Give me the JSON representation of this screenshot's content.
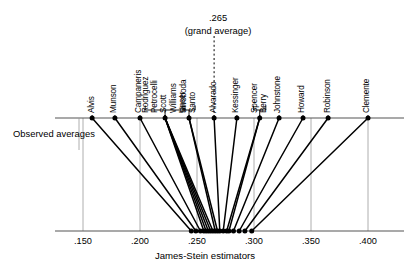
{
  "figure": {
    "observed_label": "Observed averages",
    "grand_average_value": ".265",
    "grand_average_caption": "(grand average)",
    "xaxis_title": "James-Stein estimators"
  },
  "chart_data": {
    "type": "scatter",
    "title": "",
    "subtitle": "",
    "xlabel": "James-Stein estimators",
    "ylabel": "",
    "xlim": [
      0.125,
      0.425
    ],
    "grid": true,
    "legend": "none",
    "grand_average": 0.265,
    "tick_labels": [
      ".150",
      ".200",
      ".250",
      ".300",
      ".350",
      ".400"
    ],
    "tick_values": [
      0.15,
      0.2,
      0.25,
      0.3,
      0.35,
      0.4
    ],
    "top_axis_label": "Observed averages",
    "bottom_axis_label": "James-Stein estimators",
    "series": [
      {
        "name": "Observed averages",
        "values": [
          0.158,
          0.178,
          0.2,
          0.222,
          0.23,
          0.238,
          0.244,
          0.25,
          0.254,
          0.26,
          0.265,
          0.276,
          0.286,
          0.292,
          0.298,
          0.318,
          0.333,
          0.348,
          0.362,
          0.4
        ]
      },
      {
        "name": "James-Stein estimators",
        "values": [
          0.245,
          0.249,
          0.253,
          0.255,
          0.257,
          0.259,
          0.261,
          0.263,
          0.265,
          0.266,
          0.268,
          0.27,
          0.271,
          0.273,
          0.275,
          0.279,
          0.283,
          0.287,
          0.291,
          0.298
        ]
      }
    ],
    "players": [
      {
        "label": "Alvis",
        "observed": 0.158,
        "james_stein": 0.245,
        "bracket": false
      },
      {
        "label": "Munson",
        "observed": 0.178,
        "james_stein": 0.249,
        "bracket": false
      },
      {
        "label": "Campaneris",
        "observed": 0.2,
        "james_stein": 0.253,
        "bracket": false
      },
      {
        "label": "Rodriguez",
        "observed": 0.222,
        "james_stein": 0.256,
        "bracket": true
      },
      {
        "label": "Petrocelli",
        "observed": 0.222,
        "james_stein": 0.258,
        "bracket": true
      },
      {
        "label": "Scott",
        "observed": 0.222,
        "james_stein": 0.26,
        "bracket": true
      },
      {
        "label": "Williams",
        "observed": 0.222,
        "james_stein": 0.262,
        "bracket": true
      },
      {
        "label": "Unser",
        "observed": 0.222,
        "james_stein": 0.264,
        "bracket": true
      },
      {
        "label": "Swoboda",
        "observed": 0.243,
        "james_stein": 0.266,
        "bracket": true
      },
      {
        "label": "Santo",
        "observed": 0.243,
        "james_stein": 0.268,
        "bracket": true
      },
      {
        "label": "Alvarado",
        "observed": 0.265,
        "james_stein": 0.27,
        "bracket": false
      },
      {
        "label": "Kessinger",
        "observed": 0.285,
        "james_stein": 0.273,
        "bracket": false
      },
      {
        "label": "Spencer",
        "observed": 0.305,
        "james_stein": 0.276,
        "bracket": true
      },
      {
        "label": "Berry",
        "observed": 0.305,
        "james_stein": 0.278,
        "bracket": true
      },
      {
        "label": "Johnstone",
        "observed": 0.322,
        "james_stein": 0.282,
        "bracket": false
      },
      {
        "label": "Howard",
        "observed": 0.343,
        "james_stein": 0.287,
        "bracket": false
      },
      {
        "label": "Robinson",
        "observed": 0.365,
        "james_stein": 0.292,
        "bracket": false
      },
      {
        "label": "Clemente",
        "observed": 0.4,
        "james_stein": 0.298,
        "bracket": false
      }
    ],
    "brackets": [
      {
        "members": [
          "Rodriguez",
          "Petrocelli",
          "Scott",
          "Williams",
          "Unser"
        ]
      },
      {
        "members": [
          "Swoboda",
          "Santo"
        ]
      },
      {
        "members": [
          "Spencer",
          "Berry"
        ]
      }
    ]
  }
}
